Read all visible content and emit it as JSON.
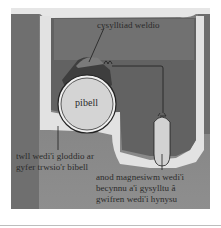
{
  "diagram": {
    "title": "",
    "colors": {
      "soil_dark": "#6e6e6e",
      "soil_mid": "#8c8c8c",
      "trench_fill": "#dcdcdc",
      "surface_band": "#b4b4b4",
      "pipe_face": "#d2d2d2",
      "pipe_body": "#4a4a4a",
      "weld_cap": "#7a7a7a",
      "anode": "#cfcfcf",
      "line": "#1e1e1e"
    },
    "labels": {
      "weld": "cysylltiad weldio",
      "pipe": "pibell",
      "trench_line1": "twll wedi'i gloddio ar",
      "trench_line2": "gyfer trwsio'r bibell",
      "anode_line1": "anod magnesiwm wedi'i",
      "anode_line2": "becynnu a'i gysylltu â",
      "anode_line3": "gwifren wedi'i hynysu"
    },
    "nodes": [
      {
        "id": "pipe",
        "label": "pibell"
      },
      {
        "id": "weld-joint",
        "label": "cysylltiad weldio"
      },
      {
        "id": "excavation",
        "label": "twll wedi'i gloddio ar gyfer trwsio'r bibell"
      },
      {
        "id": "magnesium-anode",
        "label": "anod magnesiwm wedi'i becynnu a'i gysylltu â gwifren wedi'i hynysu"
      }
    ],
    "edges": [
      {
        "from": "weld-joint",
        "to": "magnesium-anode",
        "type": "insulated-wire"
      }
    ]
  }
}
